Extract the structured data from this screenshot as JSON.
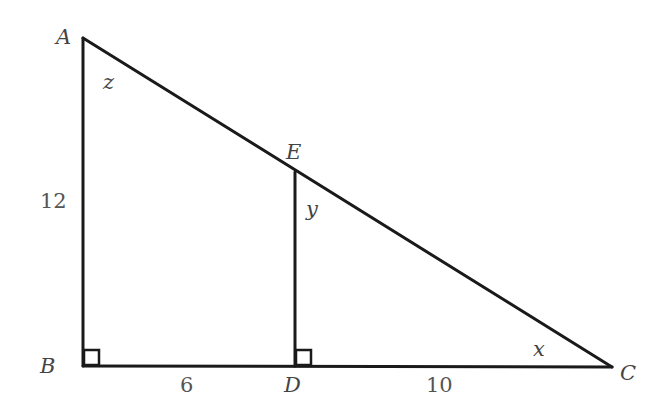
{
  "diagram": {
    "points": {
      "A": {
        "label": "A",
        "x": 83,
        "y": 38
      },
      "B": {
        "label": "B",
        "x": 83,
        "y": 366
      },
      "D": {
        "label": "D",
        "x": 295,
        "y": 366
      },
      "E": {
        "label": "E",
        "x": 295,
        "y": 172
      },
      "C": {
        "label": "C",
        "x": 612,
        "y": 367
      }
    },
    "angles": {
      "z": "z",
      "y": "y",
      "x": "x"
    },
    "lengths": {
      "AB": "12",
      "BD": "6",
      "DC": "10"
    },
    "right_angles": [
      "B",
      "D"
    ]
  }
}
